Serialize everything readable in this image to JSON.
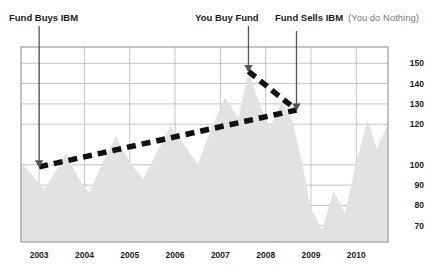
{
  "chart_data": {
    "type": "area",
    "title": "",
    "xlabel": "",
    "ylabel": "",
    "grid": true,
    "legend_position": "none",
    "xlim": [
      2002.6,
      2010.7
    ],
    "ylim": [
      62,
      158
    ],
    "x_ticks": [
      "2003",
      "2004",
      "2005",
      "2006",
      "2007",
      "2008",
      "2009",
      "2010"
    ],
    "x_tick_values": [
      2003,
      2004,
      2005,
      2006,
      2007,
      2008,
      2009,
      2010
    ],
    "y_ticks": [
      "150",
      "140",
      "130",
      "120",
      "100",
      "90",
      "80",
      "70"
    ],
    "y_tick_values": [
      150,
      140,
      130,
      120,
      100,
      90,
      80,
      70
    ],
    "series": [
      {
        "name": "IBM share price",
        "type": "area",
        "fill_color": "#e2e2e2",
        "x": [
          2002.6,
          2002.85,
          2003.1,
          2003.35,
          2003.6,
          2003.85,
          2004.1,
          2004.4,
          2004.7,
          2005.0,
          2005.3,
          2005.6,
          2005.9,
          2006.2,
          2006.5,
          2006.8,
          2007.1,
          2007.4,
          2007.62,
          2007.9,
          2008.1,
          2008.35,
          2008.6,
          2008.85,
          2009.0,
          2009.25,
          2009.5,
          2009.75,
          2010.0,
          2010.25,
          2010.45,
          2010.7
        ],
        "values": [
          101,
          95,
          88,
          96,
          106,
          94,
          86,
          101,
          114,
          101,
          93,
          106,
          119,
          110,
          100,
          118,
          133,
          123,
          146,
          128,
          118,
          131,
          121,
          96,
          78,
          68,
          87,
          76,
          101,
          122,
          108,
          120
        ]
      },
      {
        "name": "Fund value trend (steady rise)",
        "type": "line",
        "style": "dashed",
        "color": "#111111",
        "x": [
          2003.0,
          2008.68
        ],
        "values": [
          99,
          127
        ]
      },
      {
        "name": "Fund decline after you buy",
        "type": "line",
        "style": "dashed",
        "color": "#111111",
        "x": [
          2007.62,
          2008.68
        ],
        "values": [
          146,
          127
        ]
      }
    ],
    "annotations": [
      {
        "name": "fund-buys-ibm",
        "label": "Fund Buys IBM",
        "sublabel": "",
        "x": 2003.0,
        "y": 99,
        "arrow": "down"
      },
      {
        "name": "you-buy-fund",
        "label": "You Buy Fund",
        "sublabel": "",
        "x": 2007.62,
        "y": 146,
        "arrow": "down"
      },
      {
        "name": "fund-sells-ibm",
        "label": "Fund Sells IBM",
        "sublabel": "(You do Nothing)",
        "x": 2008.68,
        "y": 127,
        "arrow": "down"
      }
    ],
    "colors": {
      "area_fill": "#e2e2e2",
      "grid": "#b5b5b5",
      "axis_border": "#8a8a8a",
      "dashed_line": "#111111",
      "arrow": "#555555",
      "label_text": "#1a1a1a",
      "sublabel_text": "#7a7a7a"
    }
  }
}
